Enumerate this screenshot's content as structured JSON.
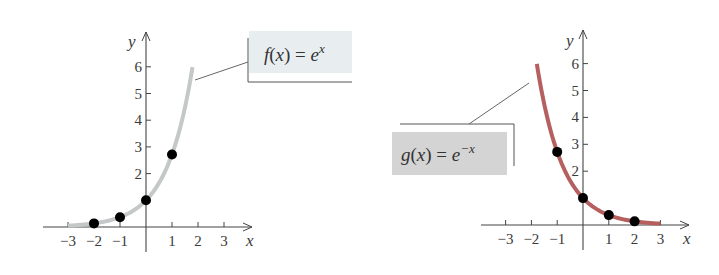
{
  "chart_data": [
    {
      "type": "line",
      "title": "",
      "function_label": "f(x) = e^x",
      "label_parts": {
        "fname": "f",
        "arg": "(x)",
        "eq": " = ",
        "base": "e",
        "exp": "x"
      },
      "xlabel": "x",
      "ylabel": "y",
      "x_ticks": [
        -3,
        -2,
        -1,
        1,
        2,
        3
      ],
      "x_tick_labels": [
        "−3",
        "−2",
        "−1",
        "1",
        "2",
        "3"
      ],
      "y_ticks": [
        2,
        3,
        4,
        5,
        6
      ],
      "y_tick_labels": [
        "2",
        "3",
        "4",
        "5",
        "6"
      ],
      "xlim": [
        -4,
        4
      ],
      "ylim": [
        0,
        6.5
      ],
      "grid": false,
      "curve": {
        "x_range": [
          -3,
          1.79
        ],
        "color": "#c4c8c8"
      },
      "points": [
        {
          "x": -2,
          "y": 0.135
        },
        {
          "x": -1,
          "y": 0.368
        },
        {
          "x": 0,
          "y": 1
        },
        {
          "x": 1,
          "y": 2.718
        }
      ],
      "label_box_color": "#e8eef0"
    },
    {
      "type": "line",
      "title": "",
      "function_label": "g(x) = e^(−x)",
      "label_parts": {
        "fname": "g",
        "arg": "(x)",
        "eq": " = ",
        "base": "e",
        "exp": "−x"
      },
      "xlabel": "x",
      "ylabel": "y",
      "x_ticks": [
        -3,
        -2,
        -1,
        1,
        2,
        3
      ],
      "x_tick_labels": [
        "−3",
        "−2",
        "−1",
        "1",
        "2",
        "3"
      ],
      "y_ticks": [
        2,
        3,
        4,
        5,
        6
      ],
      "y_tick_labels": [
        "2",
        "3",
        "4",
        "5",
        "6"
      ],
      "xlim": [
        -4,
        4
      ],
      "ylim": [
        0,
        6.5
      ],
      "grid": false,
      "curve": {
        "x_range": [
          -1.79,
          3
        ],
        "color": "#b5605f"
      },
      "points": [
        {
          "x": -1,
          "y": 2.718
        },
        {
          "x": 0,
          "y": 1
        },
        {
          "x": 1,
          "y": 0.368
        },
        {
          "x": 2,
          "y": 0.135
        }
      ],
      "label_box_color": "#d4d4d4"
    }
  ]
}
